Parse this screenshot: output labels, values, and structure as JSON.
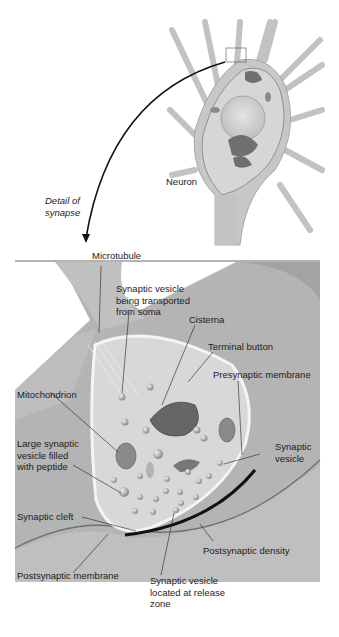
{
  "figure": {
    "type": "neuron synapse anatomy illustration",
    "colors": {
      "background": "#ffffff",
      "tissue": "#a9a9a9",
      "cytoplasm": "#d3d3d3",
      "membrane_highlight": "#f2f2f2",
      "organelle": "#707070",
      "density": "#111111"
    }
  },
  "top_panel": {
    "neuron_label": "Neuron",
    "arrow_label": "Detail of\nsynapse"
  },
  "detail_panel": {
    "labels": {
      "microtubule": "Microtubule",
      "vesicle_transported": "Synaptic vesicle\nbeing transported\nfrom soma",
      "cisterna": "Cisterna",
      "terminal_button": "Terminal button",
      "presynaptic_membrane": "Presynaptic membrane",
      "mitochondrion": "Mitochondrion",
      "large_vesicle": "Large synaptic\nvesicle filled\nwith peptide",
      "synaptic_vesicle": "Synaptic\nvesicle",
      "synaptic_cleft": "Synaptic cleft",
      "postsynaptic_density": "Postsynaptic density",
      "postsynaptic_membrane": "Postsynaptic membrane",
      "vesicle_release_zone": "Synaptic vesicle\nlocated at release\nzone"
    }
  }
}
